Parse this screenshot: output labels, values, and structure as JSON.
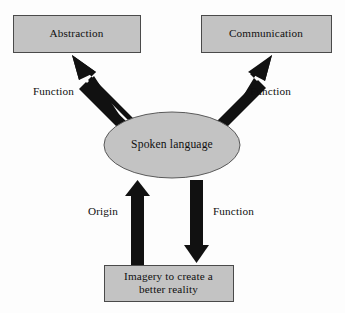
{
  "diagram": {
    "background_color": "#fdfdfd",
    "shape_fill_color": "#c3c3c3",
    "shape_border_color": "#4a4a4a",
    "arrow_color": "#111111",
    "text_color": "#101010",
    "nodes": [
      {
        "id": "abstraction",
        "shape": "rectangle",
        "label": "Abstraction",
        "x": 13,
        "y": 15,
        "width": 127,
        "height": 37
      },
      {
        "id": "communication",
        "shape": "rectangle",
        "label": "Communication",
        "x": 201,
        "y": 15,
        "width": 130,
        "height": 37
      },
      {
        "id": "spoken-language",
        "shape": "ellipse",
        "label": "Spoken language",
        "cx": 172,
        "cy": 145,
        "rx": 68,
        "ry": 33
      },
      {
        "id": "imagery",
        "shape": "rectangle",
        "label_line1": "Imagery to create a",
        "label_line2": "better reality",
        "x": 104,
        "y": 265,
        "width": 129,
        "height": 36
      }
    ],
    "edges": [
      {
        "id": "edge-abstraction",
        "from": "spoken-language",
        "to": "abstraction",
        "label": "Function",
        "label_x": 33,
        "label_y": 85,
        "direction": "up-left"
      },
      {
        "id": "edge-communication",
        "from": "spoken-language",
        "to": "communication",
        "label": "Function",
        "label_x": 250,
        "label_y": 85,
        "direction": "up-right"
      },
      {
        "id": "edge-origin",
        "from": "imagery",
        "to": "spoken-language",
        "label": "Origin",
        "label_x": 88,
        "label_y": 205,
        "direction": "up"
      },
      {
        "id": "edge-imagery-function",
        "from": "spoken-language",
        "to": "imagery",
        "label": "Function",
        "label_x": 213,
        "label_y": 205,
        "direction": "down"
      }
    ]
  }
}
